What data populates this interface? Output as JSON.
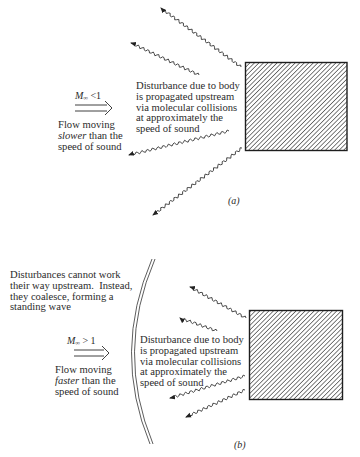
{
  "panels": [
    {
      "id": "a",
      "label": "(a)",
      "mach": {
        "symbol": "M",
        "subscript": "∞",
        "relation": "<1"
      },
      "flow_text": {
        "line1": "Flow moving",
        "line2_em": "slower",
        "line2_rest": " than the",
        "line3": "speed of sound"
      },
      "disturbance_text": [
        "Disturbance due to body",
        "is propagated upstream",
        "via molecular collisions",
        "at approximately the",
        "speed of sound"
      ],
      "body_icon": "hatched-rectangle",
      "wave_arrows": 4
    },
    {
      "id": "b",
      "label": "(b)",
      "mach": {
        "symbol": "M",
        "subscript": "∞",
        "relation": "> 1"
      },
      "flow_text": {
        "line1": "Flow moving",
        "line2_em": "faster",
        "line2_rest": " than the",
        "line3": "speed of sound"
      },
      "standing_wave_text": [
        "Disturbances cannot work",
        "their way upstream.  Instead,",
        "they coalesce, forming a",
        "standing wave"
      ],
      "disturbance_text": [
        "Disturbance due to body",
        "is propagated upstream",
        "via molecular collisions",
        "at approximately the",
        "speed of sound"
      ],
      "body_icon": "hatched-rectangle",
      "shock_wave_icon": "double-arc",
      "wave_arrows": 4
    }
  ],
  "colors": {
    "ink": "#2b2b2b",
    "background": "#ffffff"
  }
}
